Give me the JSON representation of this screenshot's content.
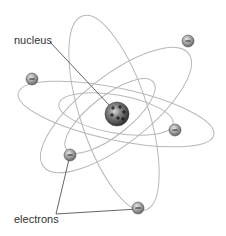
{
  "diagram": {
    "type": "atom-model",
    "labels": {
      "nucleus": "nucleus",
      "electrons": "electrons"
    },
    "nucleus": {
      "cx": 117,
      "cy": 114,
      "r": 12,
      "charges": [
        "+",
        "+",
        "+",
        "+",
        "+",
        "+"
      ]
    },
    "electrons": [
      {
        "cx": 32,
        "cy": 79,
        "symbol": "−"
      },
      {
        "cx": 188,
        "cy": 41,
        "symbol": "−"
      },
      {
        "cx": 175,
        "cy": 130,
        "symbol": "−"
      },
      {
        "cx": 70,
        "cy": 155,
        "symbol": "−"
      },
      {
        "cx": 138,
        "cy": 208,
        "symbol": "−"
      }
    ],
    "orbit_count": 4,
    "colors": {
      "orbit": "#b5b5b5",
      "leader_line": "#555555",
      "nucleus_dark": "#3a3a3a",
      "electron": "#8a8a8a",
      "text": "#333333"
    }
  }
}
